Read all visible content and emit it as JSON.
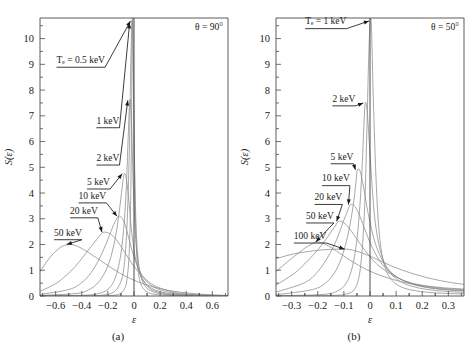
{
  "figure": {
    "panels": [
      {
        "id": "a",
        "caption": "(a)",
        "corner_label": "θ = 90°",
        "xlabel": "ε",
        "ylabel": "S(ε)",
        "xticks": [
          "−0.6",
          "−0.4",
          "−0.2",
          "0",
          "0.2",
          "0.4",
          "0.6"
        ],
        "xtick_values": [
          -0.6,
          -0.4,
          -0.2,
          0,
          0.2,
          0.4,
          0.6
        ],
        "yticks": [
          "0",
          "1",
          "2",
          "3",
          "4",
          "5",
          "6",
          "7",
          "8",
          "9",
          "10"
        ],
        "ytick_values": [
          0,
          1,
          2,
          3,
          4,
          5,
          6,
          7,
          8,
          9,
          10
        ],
        "annotations": [
          {
            "label": "Tₑ = 0.5 keV",
            "x": 0.088,
            "y": 9.05
          },
          {
            "label": "1 keV",
            "x": 0.3,
            "y": 6.7
          },
          {
            "label": "2 keV",
            "x": 0.3,
            "y": 5.25
          },
          {
            "label": "5 keV",
            "x": 0.25,
            "y": 4.32
          },
          {
            "label": "10 keV",
            "x": 0.205,
            "y": 3.78
          },
          {
            "label": "20 keV",
            "x": 0.16,
            "y": 3.2
          },
          {
            "label": "50 keV",
            "x": 0.075,
            "y": 2.35
          }
        ]
      },
      {
        "id": "b",
        "caption": "(b)",
        "corner_label": "θ = 50°",
        "xlabel": "ε",
        "ylabel": "S(ε)",
        "xticks": [
          "−0.3",
          "−0.2",
          "−0.1",
          "0",
          "0.1",
          "0.2",
          "0.3"
        ],
        "xtick_values": [
          -0.3,
          -0.2,
          -0.1,
          0,
          0.1,
          0.2,
          0.3
        ],
        "yticks": [
          "0",
          "1",
          "2",
          "3",
          "4",
          "5",
          "6",
          "7",
          "8",
          "9",
          "10"
        ],
        "ytick_values": [
          0,
          1,
          2,
          3,
          4,
          5,
          6,
          7,
          8,
          9,
          10
        ],
        "annotations": [
          {
            "label": "Tₑ = 1 keV",
            "x": 0.155,
            "y": 10.55
          },
          {
            "label": "2 keV",
            "x": 0.3,
            "y": 7.55
          },
          {
            "label": "5 keV",
            "x": 0.29,
            "y": 5.3
          },
          {
            "label": "10 keV",
            "x": 0.245,
            "y": 4.45
          },
          {
            "label": "20 keV",
            "x": 0.205,
            "y": 3.72
          },
          {
            "label": "50 keV",
            "x": 0.16,
            "y": 3.0
          },
          {
            "label": "100 keV",
            "x": 0.095,
            "y": 2.22
          }
        ]
      }
    ]
  },
  "chart_data": [
    {
      "type": "line",
      "title": "",
      "panel": "(a)",
      "xlabel": "ε",
      "ylabel": "S(ε)",
      "xlim": [
        -0.72,
        0.72
      ],
      "ylim": [
        0,
        10.8
      ],
      "grid": false,
      "legend": "inline-annotations",
      "annotation": "θ = 90°",
      "series": [
        {
          "name": "0.5 keV",
          "peak_x": -0.012,
          "peak_y": 11.5,
          "x": [
            -0.72,
            -0.3,
            -0.18,
            -0.12,
            -0.08,
            -0.055,
            -0.035,
            -0.022,
            -0.012,
            -0.004,
            0.006,
            0.018,
            0.032,
            0.05,
            0.075,
            0.11,
            0.16,
            0.24,
            0.36,
            0.5,
            0.72
          ],
          "y": [
            0.0,
            0.0,
            0.02,
            0.06,
            0.22,
            0.6,
            1.9,
            5.0,
            11.5,
            8.4,
            4.2,
            1.9,
            0.95,
            0.5,
            0.26,
            0.13,
            0.06,
            0.03,
            0.01,
            0.005,
            0.0
          ]
        },
        {
          "name": "1 keV",
          "peak_x": -0.018,
          "peak_y": 10.6,
          "x": [
            -0.72,
            -0.34,
            -0.22,
            -0.16,
            -0.115,
            -0.08,
            -0.055,
            -0.036,
            -0.024,
            -0.012,
            0.0,
            0.014,
            0.03,
            0.05,
            0.08,
            0.12,
            0.18,
            0.26,
            0.38,
            0.52,
            0.72
          ],
          "y": [
            0.0,
            0.01,
            0.05,
            0.14,
            0.4,
            1.0,
            2.6,
            5.6,
            9.2,
            10.6,
            6.4,
            3.0,
            1.5,
            0.8,
            0.42,
            0.22,
            0.11,
            0.05,
            0.02,
            0.008,
            0.0
          ]
        },
        {
          "name": "2 keV",
          "peak_x": -0.032,
          "peak_y": 7.6,
          "x": [
            -0.72,
            -0.38,
            -0.27,
            -0.2,
            -0.15,
            -0.11,
            -0.082,
            -0.06,
            -0.045,
            -0.032,
            -0.02,
            -0.005,
            0.014,
            0.035,
            0.065,
            0.105,
            0.16,
            0.24,
            0.36,
            0.52,
            0.72
          ],
          "y": [
            0.01,
            0.03,
            0.1,
            0.26,
            0.62,
            1.35,
            2.45,
            4.1,
            6.1,
            7.6,
            6.9,
            4.2,
            2.2,
            1.2,
            0.68,
            0.36,
            0.19,
            0.09,
            0.035,
            0.012,
            0.0
          ]
        },
        {
          "name": "5 keV",
          "peak_x": -0.075,
          "peak_y": 4.75,
          "x": [
            -0.72,
            -0.44,
            -0.34,
            -0.27,
            -0.21,
            -0.165,
            -0.13,
            -0.105,
            -0.088,
            -0.075,
            -0.06,
            -0.042,
            -0.02,
            0.008,
            0.045,
            0.09,
            0.15,
            0.23,
            0.35,
            0.5,
            0.72
          ],
          "y": [
            0.02,
            0.1,
            0.26,
            0.55,
            1.05,
            1.75,
            2.65,
            3.6,
            4.35,
            4.75,
            4.6,
            3.85,
            2.6,
            1.55,
            0.85,
            0.48,
            0.26,
            0.13,
            0.05,
            0.02,
            0.005
          ]
        },
        {
          "name": "10 keV",
          "peak_x": -0.115,
          "peak_y": 3.1,
          "x": [
            -0.72,
            -0.5,
            -0.4,
            -0.33,
            -0.27,
            -0.22,
            -0.185,
            -0.155,
            -0.135,
            -0.115,
            -0.095,
            -0.07,
            -0.04,
            -0.002,
            0.045,
            0.1,
            0.17,
            0.25,
            0.37,
            0.52,
            0.72
          ],
          "y": [
            0.06,
            0.25,
            0.52,
            0.9,
            1.4,
            1.95,
            2.4,
            2.78,
            2.98,
            3.1,
            3.05,
            2.8,
            2.25,
            1.55,
            0.95,
            0.55,
            0.3,
            0.17,
            0.07,
            0.03,
            0.01
          ]
        },
        {
          "name": "20 keV",
          "peak_x": -0.23,
          "peak_y": 2.48,
          "x": [
            -0.72,
            -0.6,
            -0.52,
            -0.45,
            -0.39,
            -0.34,
            -0.3,
            -0.27,
            -0.25,
            -0.23,
            -0.2,
            -0.165,
            -0.12,
            -0.065,
            0.0,
            0.075,
            0.15,
            0.24,
            0.36,
            0.52,
            0.72
          ],
          "y": [
            0.18,
            0.48,
            0.8,
            1.15,
            1.52,
            1.85,
            2.1,
            2.3,
            2.42,
            2.48,
            2.46,
            2.35,
            2.08,
            1.65,
            1.15,
            0.72,
            0.42,
            0.24,
            0.1,
            0.04,
            0.015
          ]
        },
        {
          "name": "50 keV",
          "peak_x": -0.5,
          "peak_y": 2.0,
          "x": [
            -0.72,
            -0.68,
            -0.64,
            -0.6,
            -0.56,
            -0.53,
            -0.5,
            -0.46,
            -0.42,
            -0.37,
            -0.31,
            -0.24,
            -0.16,
            -0.07,
            0.03,
            0.13,
            0.23,
            0.34,
            0.46,
            0.58,
            0.72
          ],
          "y": [
            0.95,
            1.25,
            1.52,
            1.74,
            1.9,
            1.97,
            2.0,
            1.98,
            1.9,
            1.76,
            1.56,
            1.32,
            1.05,
            0.78,
            0.55,
            0.38,
            0.25,
            0.16,
            0.09,
            0.05,
            0.02
          ]
        }
      ]
    },
    {
      "type": "line",
      "title": "",
      "panel": "(b)",
      "xlabel": "ε",
      "ylabel": "S(ε)",
      "xlim": [
        -0.36,
        0.36
      ],
      "ylim": [
        0,
        10.8
      ],
      "grid": false,
      "legend": "inline-annotations",
      "annotation": "θ = 50°",
      "series": [
        {
          "name": "1 keV",
          "peak_x": 0.004,
          "peak_y": 10.75,
          "x": [
            -0.36,
            -0.15,
            -0.09,
            -0.06,
            -0.042,
            -0.03,
            -0.02,
            -0.012,
            -0.004,
            0.004,
            0.014,
            0.026,
            0.04,
            0.06,
            0.085,
            0.12,
            0.165,
            0.225,
            0.29,
            0.36
          ],
          "y": [
            0.0,
            0.02,
            0.08,
            0.25,
            0.75,
            1.8,
            3.6,
            6.4,
            9.6,
            10.75,
            7.2,
            3.9,
            2.0,
            1.05,
            0.6,
            0.35,
            0.22,
            0.14,
            0.1,
            0.08
          ]
        },
        {
          "name": "2 keV",
          "peak_x": -0.018,
          "peak_y": 7.5,
          "x": [
            -0.36,
            -0.18,
            -0.12,
            -0.088,
            -0.066,
            -0.05,
            -0.038,
            -0.029,
            -0.023,
            -0.018,
            -0.01,
            0.002,
            0.018,
            0.04,
            0.07,
            0.11,
            0.16,
            0.22,
            0.29,
            0.36
          ],
          "y": [
            0.01,
            0.06,
            0.22,
            0.55,
            1.2,
            2.2,
            3.6,
            5.3,
            6.7,
            7.5,
            7.1,
            5.2,
            3.05,
            1.75,
            1.0,
            0.6,
            0.38,
            0.25,
            0.18,
            0.14
          ]
        },
        {
          "name": "5 keV",
          "peak_x": -0.048,
          "peak_y": 4.9,
          "x": [
            -0.36,
            -0.22,
            -0.165,
            -0.13,
            -0.105,
            -0.085,
            -0.07,
            -0.06,
            -0.053,
            -0.048,
            -0.038,
            -0.025,
            -0.006,
            0.02,
            0.055,
            0.095,
            0.145,
            0.205,
            0.28,
            0.36
          ],
          "y": [
            0.05,
            0.25,
            0.55,
            1.0,
            1.6,
            2.35,
            3.15,
            3.85,
            4.5,
            4.9,
            4.85,
            4.25,
            3.15,
            2.05,
            1.25,
            0.8,
            0.52,
            0.35,
            0.25,
            0.19
          ]
        },
        {
          "name": "10 keV",
          "peak_x": -0.075,
          "peak_y": 3.55,
          "x": [
            -0.36,
            -0.25,
            -0.2,
            -0.165,
            -0.138,
            -0.118,
            -0.102,
            -0.09,
            -0.082,
            -0.075,
            -0.062,
            -0.045,
            -0.022,
            0.008,
            0.045,
            0.09,
            0.14,
            0.2,
            0.275,
            0.36
          ],
          "y": [
            0.15,
            0.52,
            0.95,
            1.45,
            1.95,
            2.45,
            2.9,
            3.2,
            3.42,
            3.55,
            3.52,
            3.25,
            2.65,
            1.9,
            1.25,
            0.82,
            0.55,
            0.38,
            0.27,
            0.21
          ]
        },
        {
          "name": "20 keV",
          "peak_x": -0.12,
          "peak_y": 2.9,
          "x": [
            -0.36,
            -0.29,
            -0.25,
            -0.215,
            -0.185,
            -0.163,
            -0.145,
            -0.133,
            -0.126,
            -0.12,
            -0.105,
            -0.085,
            -0.055,
            -0.018,
            0.025,
            0.075,
            0.13,
            0.195,
            0.275,
            0.36
          ],
          "y": [
            0.42,
            0.88,
            1.25,
            1.62,
            1.98,
            2.28,
            2.55,
            2.72,
            2.84,
            2.9,
            2.88,
            2.7,
            2.28,
            1.75,
            1.25,
            0.88,
            0.6,
            0.42,
            0.3,
            0.24
          ]
        },
        {
          "name": "50 keV",
          "peak_x": -0.2,
          "peak_y": 2.1,
          "x": [
            -0.36,
            -0.325,
            -0.295,
            -0.27,
            -0.248,
            -0.23,
            -0.215,
            -0.206,
            -0.2,
            -0.188,
            -0.17,
            -0.145,
            -0.11,
            -0.065,
            -0.012,
            0.045,
            0.11,
            0.18,
            0.27,
            0.36
          ],
          "y": [
            0.95,
            1.25,
            1.5,
            1.7,
            1.87,
            1.98,
            2.06,
            2.09,
            2.1,
            2.08,
            2.0,
            1.86,
            1.62,
            1.32,
            1.02,
            0.78,
            0.58,
            0.44,
            0.33,
            0.27
          ]
        },
        {
          "name": "100 keV",
          "peak_x": -0.09,
          "peak_y": 1.82,
          "x": [
            -0.36,
            -0.325,
            -0.29,
            -0.255,
            -0.22,
            -0.185,
            -0.155,
            -0.125,
            -0.105,
            -0.09,
            -0.07,
            -0.045,
            -0.012,
            0.028,
            0.075,
            0.125,
            0.18,
            0.24,
            0.3,
            0.36
          ],
          "y": [
            1.45,
            1.55,
            1.64,
            1.7,
            1.75,
            1.79,
            1.81,
            1.82,
            1.82,
            1.82,
            1.79,
            1.72,
            1.6,
            1.42,
            1.2,
            1.0,
            0.82,
            0.66,
            0.54,
            0.45
          ]
        }
      ]
    }
  ]
}
